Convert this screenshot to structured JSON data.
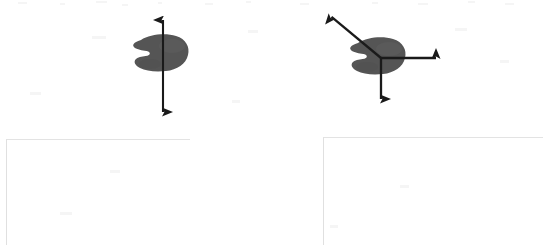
{
  "document": {
    "type": "scanned-textbook-figure",
    "background_color": "#ffffff",
    "width": 543,
    "height": 245
  },
  "palette": {
    "blob_fill": "#555555",
    "blob_fill_light": "#5e5e5e",
    "arrow_stroke": "#1a1a1a",
    "caption_border": "#e2e2e2",
    "speckle": "#efefef"
  },
  "figures": [
    {
      "id": "figure-left",
      "name": "lamina-single-axis",
      "label": "",
      "blob": {
        "name": "kidney-shaped-lamina",
        "fill": "#555555",
        "center_x": 160,
        "center_y": 54,
        "width": 54,
        "height": 37,
        "notch_side": "left"
      },
      "axes": [
        {
          "name": "vertical-axis-arrow",
          "orientation": "vertical",
          "double_headed": true,
          "x1": 163,
          "y1": 14,
          "x2": 163,
          "y2": 118,
          "label": ""
        }
      ],
      "caption_box": {
        "name": "caption-box-left",
        "x": 6,
        "y": 139,
        "width": 184,
        "height": 106,
        "text": ""
      }
    },
    {
      "id": "figure-right",
      "name": "lamina-three-axes",
      "label": "",
      "blob": {
        "name": "kidney-shaped-lamina",
        "fill": "#555555",
        "center_x": 377,
        "center_y": 57,
        "width": 54,
        "height": 37,
        "notch_side": "left"
      },
      "axes": [
        {
          "name": "diagonal-axis-arrow",
          "orientation": "diagonal-up-left",
          "double_headed": false,
          "x1": 381,
          "y1": 58,
          "x2": 327,
          "y2": 13,
          "label": ""
        },
        {
          "name": "horizontal-axis-arrow",
          "orientation": "horizontal-right",
          "double_headed": false,
          "x1": 381,
          "y1": 58,
          "x2": 442,
          "y2": 58,
          "label": ""
        },
        {
          "name": "vertical-axis-arrow",
          "orientation": "vertical-down",
          "double_headed": false,
          "x1": 381,
          "y1": 58,
          "x2": 381,
          "y2": 105,
          "label": ""
        }
      ],
      "caption_box": {
        "name": "caption-box-right",
        "x": 323,
        "y": 137,
        "width": 220,
        "height": 108,
        "text": ""
      }
    }
  ],
  "artifacts": {
    "top_edge_speckles": true,
    "description": ""
  }
}
